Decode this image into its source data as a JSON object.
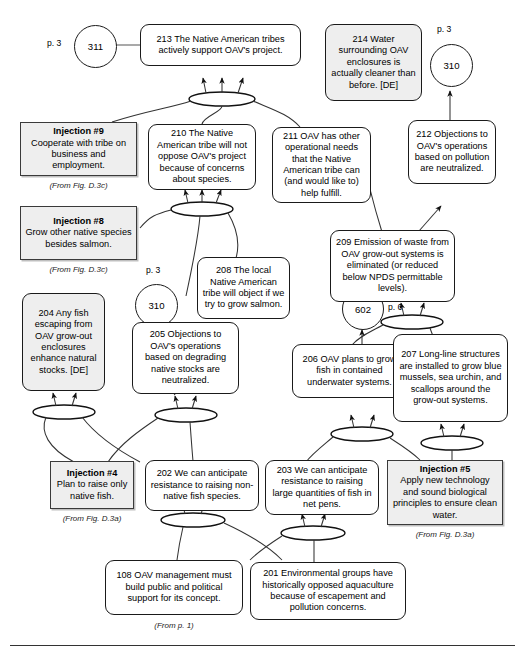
{
  "diagram": {
    "footer_rule": true,
    "nodes": [
      {
        "id": "n213",
        "kind": "statement",
        "number": "213",
        "text": "213  The Native American tribes actively support OAV's project."
      },
      {
        "id": "n214",
        "kind": "statement-de",
        "number": "214",
        "text": "214  Water surrounding OAV enclosures is actually cleaner than before. [DE]"
      },
      {
        "id": "inj9",
        "kind": "injection",
        "title": "Injection #9",
        "text": "Cooperate with tribe on business and employment.",
        "caption": "(From Fig. D.3c)"
      },
      {
        "id": "n210",
        "kind": "statement",
        "number": "210",
        "text": "210  The Native American tribe will not oppose OAV's project because of concerns about species."
      },
      {
        "id": "n211",
        "kind": "statement",
        "number": "211",
        "text": "211  OAV has other operational needs that the Native American tribe can (and would like to) help fulfill."
      },
      {
        "id": "n212",
        "kind": "statement",
        "number": "212",
        "text": "212  Objections to OAV's operations based on pollution are neutralized."
      },
      {
        "id": "inj8",
        "kind": "injection",
        "title": "Injection #8",
        "text": "Grow other native species besides salmon.",
        "caption": "(From Fig. D.3c)"
      },
      {
        "id": "n209",
        "kind": "statement",
        "number": "209",
        "text": "209  Emission of waste from OAV grow-out systems is eliminated (or reduced below NPDS permittable levels)."
      },
      {
        "id": "n208",
        "kind": "statement",
        "number": "208",
        "text": "208  The local Native American tribe will object if we try to grow salmon."
      },
      {
        "id": "n204",
        "kind": "statement-de",
        "number": "204",
        "text": "204  Any fish escaping from OAV grow-out enclosures enhance natural stocks. [DE]"
      },
      {
        "id": "n205",
        "kind": "statement",
        "number": "205",
        "text": "205  Objections to OAV's operations based on degrading native stocks are neutralized."
      },
      {
        "id": "n206",
        "kind": "statement",
        "number": "206",
        "text": "206  OAV plans to grow fish in contained underwater systems."
      },
      {
        "id": "n207",
        "kind": "statement",
        "number": "207",
        "text": "207  Long-line structures are installed to grow blue mussels, sea urchin, and scallops around the grow-out systems."
      },
      {
        "id": "inj4",
        "kind": "injection",
        "title": "Injection #4",
        "text": "Plan to raise only native fish.",
        "caption": "(From Fig. D.3a)"
      },
      {
        "id": "n202",
        "kind": "statement",
        "number": "202",
        "text": "202  We can anticipate resistance to raising non-native fish species."
      },
      {
        "id": "n203",
        "kind": "statement",
        "number": "203",
        "text": "203  We can anticipate resistance to raising large quantities of fish in net pens."
      },
      {
        "id": "inj5",
        "kind": "injection",
        "title": "Injection #5",
        "text": "Apply new technology and sound biological principles to ensure clean water.",
        "caption": "(From Fig. D.3a)"
      },
      {
        "id": "n108",
        "kind": "statement",
        "number": "108",
        "text": "108  OAV management must build public and political support for its concept.",
        "caption": "(From p. 1)"
      },
      {
        "id": "n201",
        "kind": "statement",
        "number": "201",
        "text": "201  Environmental groups have historically opposed aquaculture because of escapement and pollution concerns."
      }
    ],
    "connectors": [
      {
        "id": "c311",
        "label": "311",
        "page": "p. 3"
      },
      {
        "id": "c310top",
        "label": "310",
        "page": "p. 3"
      },
      {
        "id": "c310mid",
        "label": "310",
        "page": "p. 3"
      },
      {
        "id": "c602",
        "label": "602",
        "page": "p. 6"
      }
    ],
    "and_junctions": 7
  }
}
